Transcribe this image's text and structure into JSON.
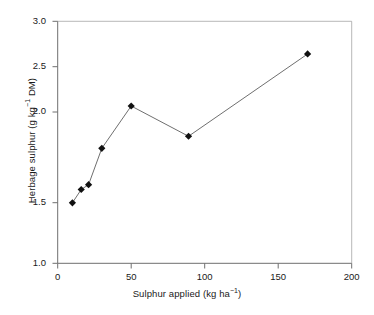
{
  "chart_data": {
    "type": "line",
    "title": "",
    "xlabel_plain": "Sulphur applied (kg ha-1)",
    "ylabel_plain": "Herbage sulphur (g kg-1 DM)",
    "x": [
      10,
      16,
      21,
      30,
      50,
      89,
      170
    ],
    "values": [
      1.5,
      1.61,
      1.65,
      1.95,
      2.3,
      2.05,
      2.73
    ],
    "series": [
      {
        "name": "Herbage sulphur",
        "x": [
          10,
          16,
          21,
          30,
          50,
          89,
          170
        ],
        "values": [
          1.5,
          1.61,
          1.65,
          1.95,
          2.3,
          2.05,
          2.73
        ],
        "marker": "filled-diamond",
        "marker_color": "#111111",
        "line_color": "#6f6f6f"
      }
    ],
    "xlim": [
      0,
      200
    ],
    "ylim": [
      1.0,
      3.0
    ],
    "xticks": [
      0,
      50,
      100,
      150,
      200
    ],
    "yticks": [
      1.0,
      1.5,
      2.0,
      2.5,
      3.0
    ],
    "xtick_labels": [
      "0",
      "50",
      "100",
      "150",
      "200"
    ],
    "ytick_labels": [
      "1.0",
      "1.5",
      "2.0",
      "2.5",
      "3.0"
    ],
    "grid": false,
    "legend": null,
    "legend_position": "none",
    "annotations": []
  },
  "axes": {
    "x_title": {
      "prefix": "Sulphur applied (kg ha",
      "superscript": "−1",
      "suffix": ")"
    },
    "y_title": {
      "prefix": "Herbage sulphur (g kg",
      "superscript": "−1",
      "suffix": " DM)"
    }
  },
  "ticks": {
    "y": [
      "3.0",
      "2.5",
      "2.0",
      "1.5",
      "1.0"
    ],
    "x": [
      "0",
      "50",
      "100",
      "150",
      "200"
    ]
  },
  "colors": {
    "axis": "#6f6f6f",
    "line": "#6f6f6f",
    "marker": "#111111",
    "text": "#1a1a1a",
    "background": "#ffffff"
  }
}
